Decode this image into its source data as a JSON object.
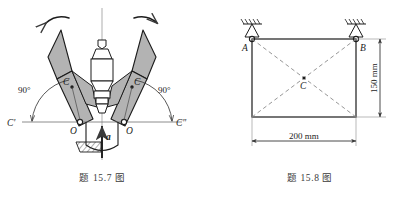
{
  "page": {
    "background_color": "#ffffff",
    "ink_color": "#3a3a3a",
    "fill_gray": "#b3b3b3"
  },
  "figures": [
    {
      "id": "fig-15-7",
      "caption": "题 15.7 图",
      "title": "Centrifugal governor with two flyball arms",
      "labels": {
        "angle_left": "90°",
        "angle_right": "90°",
        "pivot_left": "O",
        "pivot_right": "O",
        "mass_center_left": "C",
        "mass_center_right": "C",
        "ref_left": "C'",
        "ref_right": "C\"",
        "acceleration": "a"
      },
      "annotations": {
        "rotation_arrow_left": "curved-rotation-arrow",
        "rotation_arrow_right": "curved-rotation-arrow",
        "hatching": "section-hatch",
        "axis": "vertical-centerline"
      }
    },
    {
      "id": "fig-15-8",
      "caption": "题 15.8 图",
      "title": "Rectangular plate pinned at A and B",
      "labels": {
        "corner_a": "A",
        "corner_b": "B",
        "centroid": "C",
        "dim_width": "200 mm",
        "dim_height": "150 mm"
      },
      "annotations": {
        "support_a": "pin-support-icon",
        "support_b": "pin-support-icon",
        "diagonals": "dashed-diagonals",
        "ground_hatch_a": "ground-hatch",
        "ground_hatch_b": "ground-hatch"
      },
      "geometry": {
        "width_mm": 200,
        "height_mm": 150
      }
    }
  ]
}
